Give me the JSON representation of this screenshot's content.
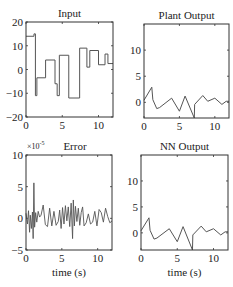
{
  "figure": {
    "width": 233,
    "height": 287,
    "line_color": "#555555",
    "axis_color": "#333333",
    "text_color": "#222222"
  },
  "chart_data": [
    {
      "type": "line",
      "id": "input",
      "title": "Input",
      "xlabel": "",
      "ylabel": "",
      "xlim": [
        0,
        12
      ],
      "ylim": [
        -20,
        20
      ],
      "xticks": [
        0,
        5,
        10
      ],
      "yticks": [
        -20,
        -10,
        0,
        10,
        20
      ],
      "ytick_labels": [
        "−20",
        "−10",
        "0",
        "10",
        "20"
      ],
      "multiplier": "",
      "grid": false,
      "box": {
        "x": 26,
        "y": 22,
        "w": 87,
        "h": 95
      },
      "series": [
        {
          "name": "input",
          "step": true,
          "x": [
            0,
            1.1,
            1.1,
            1.3,
            1.3,
            1.5,
            1.5,
            2.7,
            2.7,
            4.0,
            4.0,
            4.3,
            4.3,
            4.6,
            4.6,
            5.9,
            5.9,
            7.4,
            7.4,
            8.4,
            8.4,
            8.8,
            8.8,
            10.0,
            10.0,
            10.9,
            10.9,
            11.3,
            11.3,
            12
          ],
          "y": [
            14,
            14,
            15,
            15,
            -11,
            -11,
            -3.5,
            -3.5,
            4,
            4,
            -6,
            -6,
            -11,
            -11,
            6,
            6,
            -12,
            -12,
            9,
            9,
            1,
            1,
            8,
            8,
            2,
            2,
            6.5,
            6.5,
            2.5,
            2.5
          ]
        }
      ]
    },
    {
      "type": "line",
      "id": "plant_output",
      "title": "Plant Output",
      "xlabel": "",
      "ylabel": "",
      "xlim": [
        0,
        12
      ],
      "ylim": [
        -3,
        15
      ],
      "xticks": [
        0,
        5,
        10
      ],
      "yticks": [
        0,
        5,
        10
      ],
      "ytick_labels": [
        "0",
        "5",
        "10"
      ],
      "multiplier": "",
      "grid": false,
      "box": {
        "x": 144,
        "y": 24,
        "w": 85,
        "h": 94
      },
      "series": [
        {
          "name": "plant output",
          "x": [
            0,
            1.1,
            1.25,
            1.8,
            2.2,
            3.9,
            5.0,
            5.8,
            7.1,
            7.15,
            8.3,
            9.0,
            10.0,
            11.0,
            11.6,
            12
          ],
          "y": [
            0.4,
            2.9,
            0.5,
            -1.2,
            -1.0,
            0.8,
            -1.7,
            1.2,
            -3.3,
            -0.4,
            1.3,
            0.2,
            0.8,
            -0.4,
            0.2,
            0.2
          ]
        }
      ]
    },
    {
      "type": "line",
      "id": "error",
      "title": "Error",
      "xlabel": "time (s)",
      "ylabel": "",
      "xlim": [
        0,
        12
      ],
      "ylim": [
        -5,
        10
      ],
      "xticks": [
        0,
        5,
        10
      ],
      "yticks": [
        -5,
        0,
        5,
        10
      ],
      "ytick_labels": [
        "−5",
        "0",
        "5",
        "10"
      ],
      "multiplier": "×10",
      "multiplier_exp": "-5",
      "grid": false,
      "box": {
        "x": 26,
        "y": 155,
        "w": 86,
        "h": 95
      },
      "series": [
        {
          "name": "error (x1e-5)",
          "x": [
            0,
            0.2,
            0.35,
            0.5,
            0.6,
            0.75,
            0.9,
            1.0,
            1.1,
            1.2,
            1.35,
            1.5,
            1.7,
            1.9,
            2.1,
            2.4,
            2.7,
            3.0,
            3.3,
            3.6,
            3.9,
            4.2,
            4.5,
            4.7,
            4.9,
            5.1,
            5.3,
            5.5,
            5.7,
            5.9,
            6.1,
            6.3,
            6.5,
            6.6,
            6.75,
            6.9,
            7.1,
            7.3,
            7.5,
            7.7,
            7.9,
            8.1,
            8.4,
            8.7,
            9.0,
            9.3,
            9.6,
            9.9,
            10.2,
            10.5,
            10.8,
            11.1,
            11.4,
            11.7,
            12
          ],
          "y": [
            0.8,
            -0.9,
            1.2,
            -2.2,
            0.5,
            -1.6,
            1.0,
            -3.2,
            5.6,
            -1.4,
            0.9,
            -0.6,
            1.1,
            0.2,
            0.5,
            2.1,
            -1.0,
            -1.3,
            1.6,
            -1.2,
            1.1,
            -1.1,
            -0.5,
            1.3,
            -1.6,
            1.7,
            -0.9,
            2.0,
            -0.4,
            1.8,
            -1.3,
            2.4,
            -3.2,
            2.9,
            -1.2,
            1.9,
            -0.5,
            1.6,
            -1.1,
            0.9,
            1.8,
            -1.2,
            -0.7,
            0.7,
            -0.9,
            -0.6,
            1.1,
            -1.2,
            1.4,
            0.9,
            -0.6,
            1.6,
            0.3,
            -0.7,
            -0.4
          ]
        }
      ]
    },
    {
      "type": "line",
      "id": "nn_output",
      "title": "NN Output",
      "xlabel": "time (s)",
      "ylabel": "",
      "xlim": [
        0,
        12
      ],
      "ylim": [
        -3.3,
        15
      ],
      "xticks": [
        0,
        5,
        10
      ],
      "yticks": [
        0,
        5,
        10
      ],
      "ytick_labels": [
        "0",
        "5",
        "10"
      ],
      "multiplier": "",
      "grid": false,
      "box": {
        "x": 141,
        "y": 155,
        "w": 87,
        "h": 95
      },
      "series": [
        {
          "name": "nn output",
          "x": [
            0,
            1.1,
            1.25,
            1.8,
            2.2,
            3.9,
            5.0,
            5.8,
            7.1,
            7.15,
            8.3,
            9.0,
            10.0,
            11.0,
            11.6,
            12
          ],
          "y": [
            0.4,
            2.9,
            0.5,
            -1.2,
            -1.0,
            0.8,
            -1.7,
            1.2,
            -3.3,
            -0.4,
            1.3,
            0.2,
            0.8,
            -0.4,
            0.2,
            0.2
          ]
        }
      ]
    }
  ]
}
